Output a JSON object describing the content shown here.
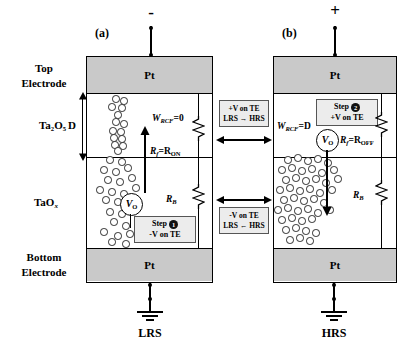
{
  "figure": {
    "type": "device-schematic"
  },
  "panels": [
    {
      "tag": "(a)",
      "terminal_sign": "-",
      "top_electrode_label": "Pt",
      "bottom_electrode_label": "Pt",
      "state_label": "LRS",
      "formulas": {
        "w": "W",
        "w_sub": "RCF",
        "w_value": "=0",
        "r": "R",
        "r_sub": "f",
        "r_value": "=R",
        "r_value_sub": "ON",
        "rb": "R",
        "rb_sub": "B"
      },
      "vo_label": "V",
      "vo_sub": "O",
      "step": {
        "title": "Step",
        "number": "1",
        "action": "-V on TE"
      },
      "filament_arrow_direction": "up"
    },
    {
      "tag": "(b)",
      "terminal_sign": "+",
      "top_electrode_label": "Pt",
      "bottom_electrode_label": "Pt",
      "state_label": "HRS",
      "formulas": {
        "w": "W",
        "w_sub": "RCF",
        "w_value": "=D",
        "r": "R",
        "r_sub": "f",
        "r_value": "=R",
        "r_value_sub": "OFF",
        "rb": "R",
        "rb_sub": "B"
      },
      "vo_label": "V",
      "vo_sub": "O",
      "step": {
        "title": "Step",
        "number": "2",
        "action": "+V on TE"
      },
      "filament_arrow_direction": "down"
    }
  ],
  "side_labels": {
    "top_electrode_line1": "Top",
    "top_electrode_line2": "Electrode",
    "oxide_top": "Ta₂O₅",
    "thickness_symbol": "D",
    "oxide_bottom": "TaO",
    "oxide_bottom_sub": "x",
    "bottom_electrode_line1": "Bottom",
    "bottom_electrode_line2": "Electrode"
  },
  "transitions": [
    {
      "id": "lrs-to-hrs",
      "line1": "+V on TE",
      "line2": "LRS → HRS",
      "arrow": "double"
    },
    {
      "id": "hrs-to-lrs",
      "line1": "-V on TE",
      "line2": "LRS ← HRS",
      "arrow": "double"
    }
  ],
  "colors": {
    "electrode_fill": "#c9c9c9",
    "callout_fill": "#ececec",
    "stroke": "#000000",
    "vacancy_stroke": "#2b2b2b"
  },
  "vacancies_a": [
    [
      116,
      99
    ],
    [
      124,
      101
    ],
    [
      112,
      107
    ],
    [
      122,
      108
    ],
    [
      118,
      115
    ],
    [
      116,
      122
    ],
    [
      124,
      124
    ],
    [
      113,
      131
    ],
    [
      121,
      132
    ],
    [
      114,
      138
    ],
    [
      122,
      139
    ],
    [
      115,
      145
    ],
    [
      123,
      146
    ],
    [
      118,
      151
    ],
    [
      110,
      160
    ],
    [
      122,
      162
    ],
    [
      104,
      170
    ],
    [
      116,
      172
    ],
    [
      128,
      168
    ],
    [
      108,
      180
    ],
    [
      120,
      182
    ],
    [
      132,
      178
    ],
    [
      100,
      190
    ],
    [
      112,
      192
    ],
    [
      124,
      194
    ],
    [
      136,
      188
    ],
    [
      106,
      200
    ],
    [
      118,
      202
    ],
    [
      130,
      204
    ],
    [
      110,
      212
    ],
    [
      122,
      214
    ],
    [
      134,
      210
    ],
    [
      114,
      222
    ],
    [
      126,
      226
    ],
    [
      104,
      232
    ],
    [
      118,
      236
    ],
    [
      130,
      234
    ],
    [
      112,
      242
    ],
    [
      126,
      244
    ]
  ],
  "vacancies_b": [
    [
      288,
      160
    ],
    [
      298,
      158
    ],
    [
      308,
      161
    ],
    [
      318,
      159
    ],
    [
      328,
      163
    ],
    [
      282,
      170
    ],
    [
      292,
      168
    ],
    [
      302,
      171
    ],
    [
      312,
      169
    ],
    [
      322,
      173
    ],
    [
      334,
      170
    ],
    [
      286,
      180
    ],
    [
      296,
      178
    ],
    [
      306,
      181
    ],
    [
      316,
      179
    ],
    [
      326,
      183
    ],
    [
      338,
      179
    ],
    [
      280,
      190
    ],
    [
      290,
      188
    ],
    [
      300,
      191
    ],
    [
      310,
      189
    ],
    [
      320,
      193
    ],
    [
      332,
      190
    ],
    [
      284,
      200
    ],
    [
      294,
      198
    ],
    [
      304,
      201
    ],
    [
      314,
      199
    ],
    [
      324,
      203
    ],
    [
      278,
      210
    ],
    [
      288,
      208
    ],
    [
      298,
      211
    ],
    [
      308,
      209
    ],
    [
      318,
      213
    ],
    [
      330,
      210
    ],
    [
      282,
      220
    ],
    [
      292,
      218
    ],
    [
      302,
      221
    ],
    [
      312,
      219
    ],
    [
      286,
      230
    ],
    [
      296,
      228
    ],
    [
      306,
      231
    ],
    [
      316,
      233
    ],
    [
      290,
      240
    ],
    [
      300,
      238
    ],
    [
      310,
      241
    ]
  ]
}
